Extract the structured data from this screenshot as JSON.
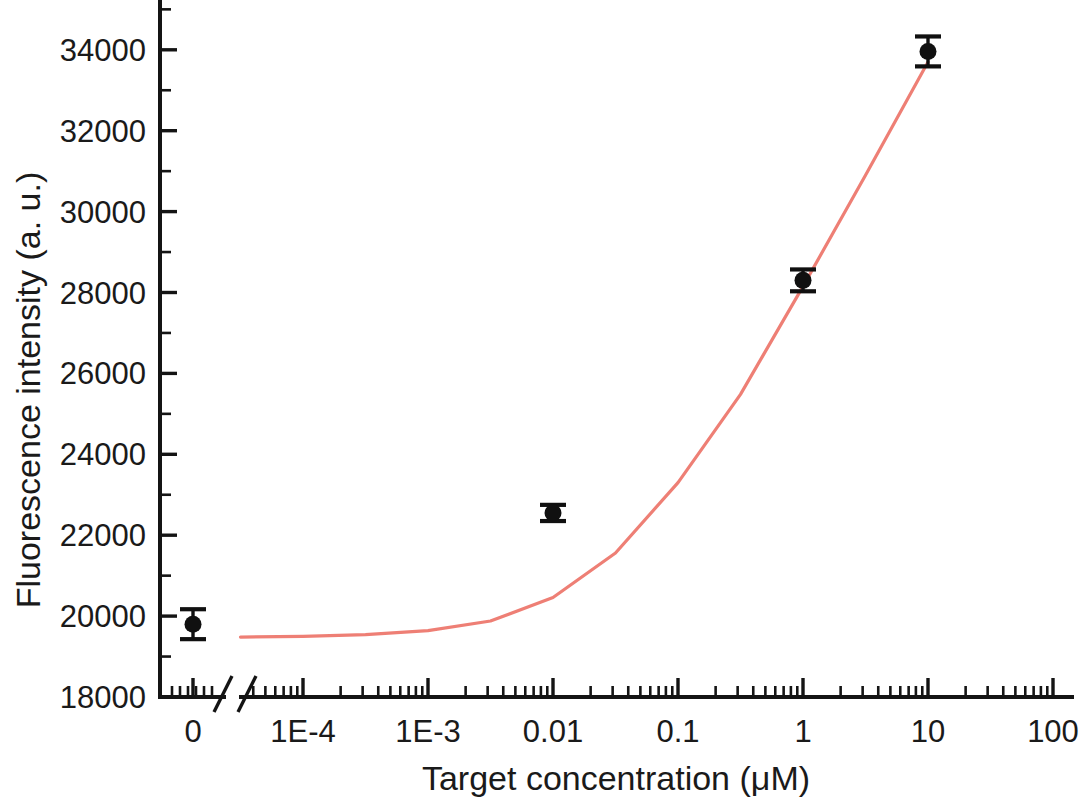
{
  "chart_data": {
    "type": "scatter",
    "title": "",
    "xlabel": "Target concentration (μM)",
    "ylabel": "Fluorescence intensity (a. u.)",
    "x_tick_labels": [
      "0",
      "1E-4",
      "1E-3",
      "0.01",
      "0.1",
      "1",
      "10",
      "100"
    ],
    "x_scale": "log-with-zero-break",
    "x_axis_break": true,
    "xlim_log": [
      -4.5,
      2.0
    ],
    "y_tick_labels": [
      "18000",
      "20000",
      "22000",
      "24000",
      "26000",
      "28000",
      "30000",
      "32000",
      "34000"
    ],
    "ylim": [
      18000,
      34500
    ],
    "y_major_step": 2000,
    "y_minor_step": 1000,
    "grid": false,
    "legend": "none",
    "series": [
      {
        "name": "Fluorescence response",
        "marker": "filled-circle",
        "color": "#101010",
        "x": [
          0,
          0.01,
          1,
          10
        ],
        "x_labels": [
          "0",
          "0.01",
          "1",
          "10"
        ],
        "values": [
          19800,
          22550,
          28300,
          33960
        ],
        "errors": [
          370,
          200,
          270,
          370
        ]
      },
      {
        "name": "Fitted curve",
        "type": "line",
        "color": "#ee7f75",
        "x_log": [
          -4.5,
          -4.0,
          -3.5,
          -3.0,
          -2.5,
          -2.0,
          -1.5,
          -1.0,
          -0.5,
          0.0,
          0.5,
          1.0
        ],
        "values": [
          19480,
          19500,
          19540,
          19640,
          19880,
          20460,
          21560,
          23300,
          25480,
          28150,
          30900,
          33700
        ]
      }
    ]
  },
  "axis": {
    "x_title": "Target concentration (μM)",
    "y_title": "Fluorescence intensity (a. u.)",
    "x_ticks": [
      {
        "label": "0",
        "px": 193
      },
      {
        "label": "1E-4",
        "px": 303
      },
      {
        "label": "1E-3",
        "px": 428
      },
      {
        "label": "0.01",
        "px": 553
      },
      {
        "label": "0.1",
        "px": 678
      },
      {
        "label": "1",
        "px": 803
      },
      {
        "label": "10",
        "px": 928
      },
      {
        "label": "100",
        "px": 1053
      }
    ],
    "y_ticks": [
      {
        "label": "18000",
        "value": 18000
      },
      {
        "label": "20000",
        "value": 20000
      },
      {
        "label": "22000",
        "value": 22000
      },
      {
        "label": "24000",
        "value": 24000
      },
      {
        "label": "26000",
        "value": 26000
      },
      {
        "label": "28000",
        "value": 28000
      },
      {
        "label": "30000",
        "value": 30000
      },
      {
        "label": "32000",
        "value": 32000
      },
      {
        "label": "34000",
        "value": 34000
      }
    ]
  },
  "colors": {
    "curve": "#ee7f75",
    "marker": "#101010",
    "axis": "#141414",
    "background": "#ffffff"
  }
}
